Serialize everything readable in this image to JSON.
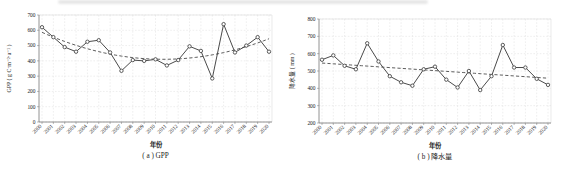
{
  "figure": {
    "background": "#ffffff",
    "panel_count": 2
  },
  "chart_data": [
    {
      "type": "line",
      "title": "( a ) GPP",
      "xlabel": "年份",
      "ylabel": "GPP ( g C·m⁻²·a⁻¹ )",
      "categories": [
        "2000",
        "2001",
        "2002",
        "2003",
        "2004",
        "2005",
        "2006",
        "2007",
        "2008",
        "2009",
        "2010",
        "2011",
        "2012",
        "2013",
        "2014",
        "2015",
        "2016",
        "2017",
        "2018",
        "2019",
        "2020"
      ],
      "series": [
        {
          "name": "GPP",
          "values": [
            620,
            555,
            490,
            460,
            525,
            535,
            455,
            335,
            405,
            400,
            410,
            370,
            405,
            495,
            465,
            285,
            640,
            455,
            500,
            555,
            460
          ]
        }
      ],
      "trend": {
        "kind": "polynomial",
        "order": 2,
        "style": "dashed"
      },
      "ylim": [
        0,
        700
      ],
      "yticks": [
        0,
        100,
        200,
        300,
        400,
        500,
        600,
        700
      ],
      "grid": true,
      "legend": "none",
      "marker": "open-circle",
      "colors": {
        "line": "#4a4a4a",
        "marker_fill": "#ffffff",
        "trend": "#4a4a4a",
        "grid": "#dcdcdc",
        "spine": "#777777",
        "text": "#1c1c1c"
      }
    },
    {
      "type": "line",
      "title": "( b ) 降水量",
      "xlabel": "年份",
      "ylabel": "降水量 ( mm )",
      "categories": [
        "2000",
        "2001",
        "2002",
        "2003",
        "2004",
        "2005",
        "2006",
        "2007",
        "2008",
        "2009",
        "2010",
        "2011",
        "2012",
        "2013",
        "2014",
        "2015",
        "2016",
        "2017",
        "2018",
        "2019",
        "2020"
      ],
      "series": [
        {
          "name": "降水量",
          "values": [
            565,
            590,
            530,
            510,
            660,
            555,
            470,
            435,
            415,
            510,
            525,
            450,
            405,
            500,
            390,
            470,
            650,
            520,
            520,
            455,
            420
          ]
        }
      ],
      "trend": {
        "kind": "polynomial",
        "order": 1,
        "style": "dashed"
      },
      "ylim": [
        200,
        800
      ],
      "yticks": [
        200,
        300,
        400,
        500,
        600,
        700,
        800
      ],
      "grid": true,
      "legend": "none",
      "marker": "open-circle",
      "colors": {
        "line": "#4a4a4a",
        "marker_fill": "#ffffff",
        "trend": "#4a4a4a",
        "grid": "#dcdcdc",
        "spine": "#777777",
        "text": "#1c1c1c"
      }
    }
  ]
}
